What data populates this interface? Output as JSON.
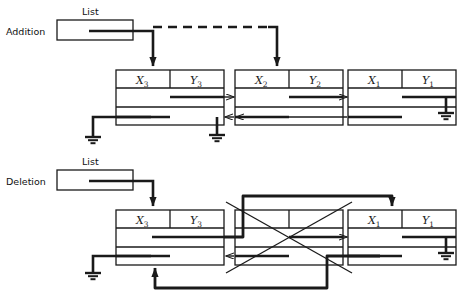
{
  "diagram": {
    "type": "linked-list-diagram",
    "stroke_color": "#1a1a1a",
    "accent_color": "#000000",
    "background": "#ffffff"
  },
  "sections": [
    {
      "id": "addition",
      "operation_label": "Addition",
      "list_label": "List",
      "list_box": {
        "x": 57,
        "y": 20,
        "w": 76,
        "h": 20
      },
      "nodes": [
        {
          "id": "n3",
          "x_label": "X",
          "x_sub": "3",
          "y_label": "Y",
          "y_sub": "3",
          "box": {
            "x": 116,
            "y": 70,
            "w": 108,
            "h": 55
          }
        },
        {
          "id": "n2",
          "x_label": "X",
          "x_sub": "2",
          "y_label": "Y",
          "y_sub": "2",
          "box": {
            "x": 235,
            "y": 70,
            "w": 108,
            "h": 55
          }
        },
        {
          "id": "n1",
          "x_label": "X",
          "x_sub": "1",
          "y_label": "Y",
          "y_sub": "1",
          "box": {
            "x": 348,
            "y": 70,
            "w": 108,
            "h": 55
          }
        }
      ],
      "dashed_link": true,
      "ground_count": 3
    },
    {
      "id": "deletion",
      "operation_label": "Deletion",
      "list_label": "List",
      "list_box": {
        "x": 57,
        "y": 170,
        "w": 76,
        "h": 20
      },
      "nodes": [
        {
          "id": "d3",
          "x_label": "X",
          "x_sub": "3",
          "y_label": "Y",
          "y_sub": "3",
          "box": {
            "x": 116,
            "y": 210,
            "w": 108,
            "h": 55
          },
          "deleted": false
        },
        {
          "id": "ddel",
          "x_label": "",
          "x_sub": "",
          "y_label": "",
          "y_sub": "",
          "box": {
            "x": 235,
            "y": 210,
            "w": 108,
            "h": 55
          },
          "deleted": true
        },
        {
          "id": "d1",
          "x_label": "X",
          "x_sub": "1",
          "y_label": "Y",
          "y_sub": "1",
          "box": {
            "x": 348,
            "y": 210,
            "w": 108,
            "h": 55
          },
          "deleted": false
        }
      ],
      "dashed_link": false,
      "ground_count": 2
    }
  ],
  "icons": {
    "ground": "ground-symbol",
    "arrow": "arrow-head",
    "cross": "deleted-node-cross"
  }
}
